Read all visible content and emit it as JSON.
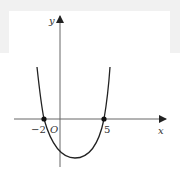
{
  "figure": {
    "x_axis_label": "x",
    "y_axis_label": "y",
    "origin_label": "O",
    "roots": [
      {
        "label": "−2",
        "value": -2
      },
      {
        "label": "5",
        "value": 5
      }
    ],
    "curve": "upward-opening parabola",
    "colors": {
      "axis": "#666666",
      "curve": "#222222",
      "background_band": "#f1f1f1"
    }
  }
}
